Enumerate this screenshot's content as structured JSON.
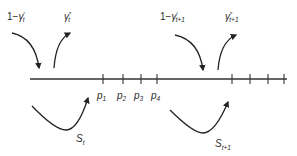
{
  "diagram": {
    "type": "timeline-flow",
    "axis": {
      "x_start": 30,
      "x_end": 287,
      "y": 79
    },
    "ticks": {
      "period_t": [
        103,
        123,
        141,
        157
      ],
      "period_t1": [
        232,
        250,
        268,
        284
      ]
    },
    "tick_labels": [
      {
        "base": "p",
        "sub": "1",
        "x": 98
      },
      {
        "base": "p",
        "sub": "2",
        "x": 117
      },
      {
        "base": "p",
        "sub": "3",
        "x": 135
      },
      {
        "base": "p",
        "sub": "4",
        "x": 152
      }
    ],
    "flows": {
      "inflow_t": {
        "prefix": "1−",
        "base": "γ",
        "sup": "′",
        "sub": "t"
      },
      "outflow_t": {
        "base": "γ",
        "sup": "″",
        "sub": "t"
      },
      "inflow_t1": {
        "prefix": "1−",
        "base": "γ",
        "sup": "′",
        "sub": "t+1"
      },
      "outflow_t1": {
        "base": "γ",
        "sup": "″",
        "sub": "t+1"
      },
      "search_t": {
        "base": "S",
        "sub": "t"
      },
      "search_t1": {
        "base": "S",
        "sub": "t+1"
      }
    },
    "colors": {
      "line": "#222222",
      "text": "#2a2a2a",
      "background": "#ffffff"
    }
  }
}
